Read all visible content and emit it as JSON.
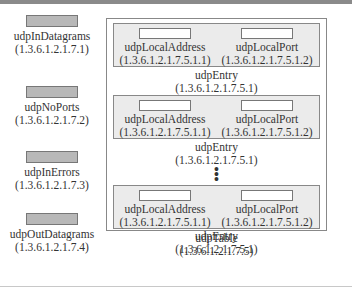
{
  "scalars": [
    {
      "name": "udpInDatagrams",
      "oid": "(1.3.6.1.2.1.7.1)"
    },
    {
      "name": "udpNoPorts",
      "oid": "(1.3.6.1.2.1.7.2)"
    },
    {
      "name": "udpInErrors",
      "oid": "(1.3.6.1.2.1.7.3)"
    },
    {
      "name": "udpOutDatagrams",
      "oid": "(1.3.6.1.2.1.7.4)"
    }
  ],
  "table": {
    "name": "udpTable",
    "oid": "(1.3.6.1.2.1.7.5)",
    "entries": [
      {
        "col1_name": "udpLocalAddress",
        "col1_oid": "(1.3.6.1.2.1.7.5.1.1)",
        "col2_name": "udpLocalPort",
        "col2_oid": "(1.3.6.1.2.1.7.5.1.2)",
        "entry_name": "udpEntry",
        "entry_oid": "(1.3.6.1.2.1.7.5.1)"
      },
      {
        "col1_name": "udpLocalAddress",
        "col1_oid": "(1.3.6.1.2.1.7.5.1.1)",
        "col2_name": "udpLocalPort",
        "col2_oid": "(1.3.6.1.2.1.7.5.1.2)",
        "entry_name": "udpEntry",
        "entry_oid": "(1.3.6.1.2.1.7.5.1)"
      },
      {
        "col1_name": "udpLocalAddress",
        "col1_oid": "(1.3.6.1.2.1.7.5.1.1)",
        "col2_name": "udpLocalPort",
        "col2_oid": "(1.3.6.1.2.1.7.5.1.2)",
        "entry_name": "udpEntry",
        "entry_oid": "(1.3.6.1.2.1.7.5.1)"
      }
    ],
    "ellipsis": "⋮"
  }
}
